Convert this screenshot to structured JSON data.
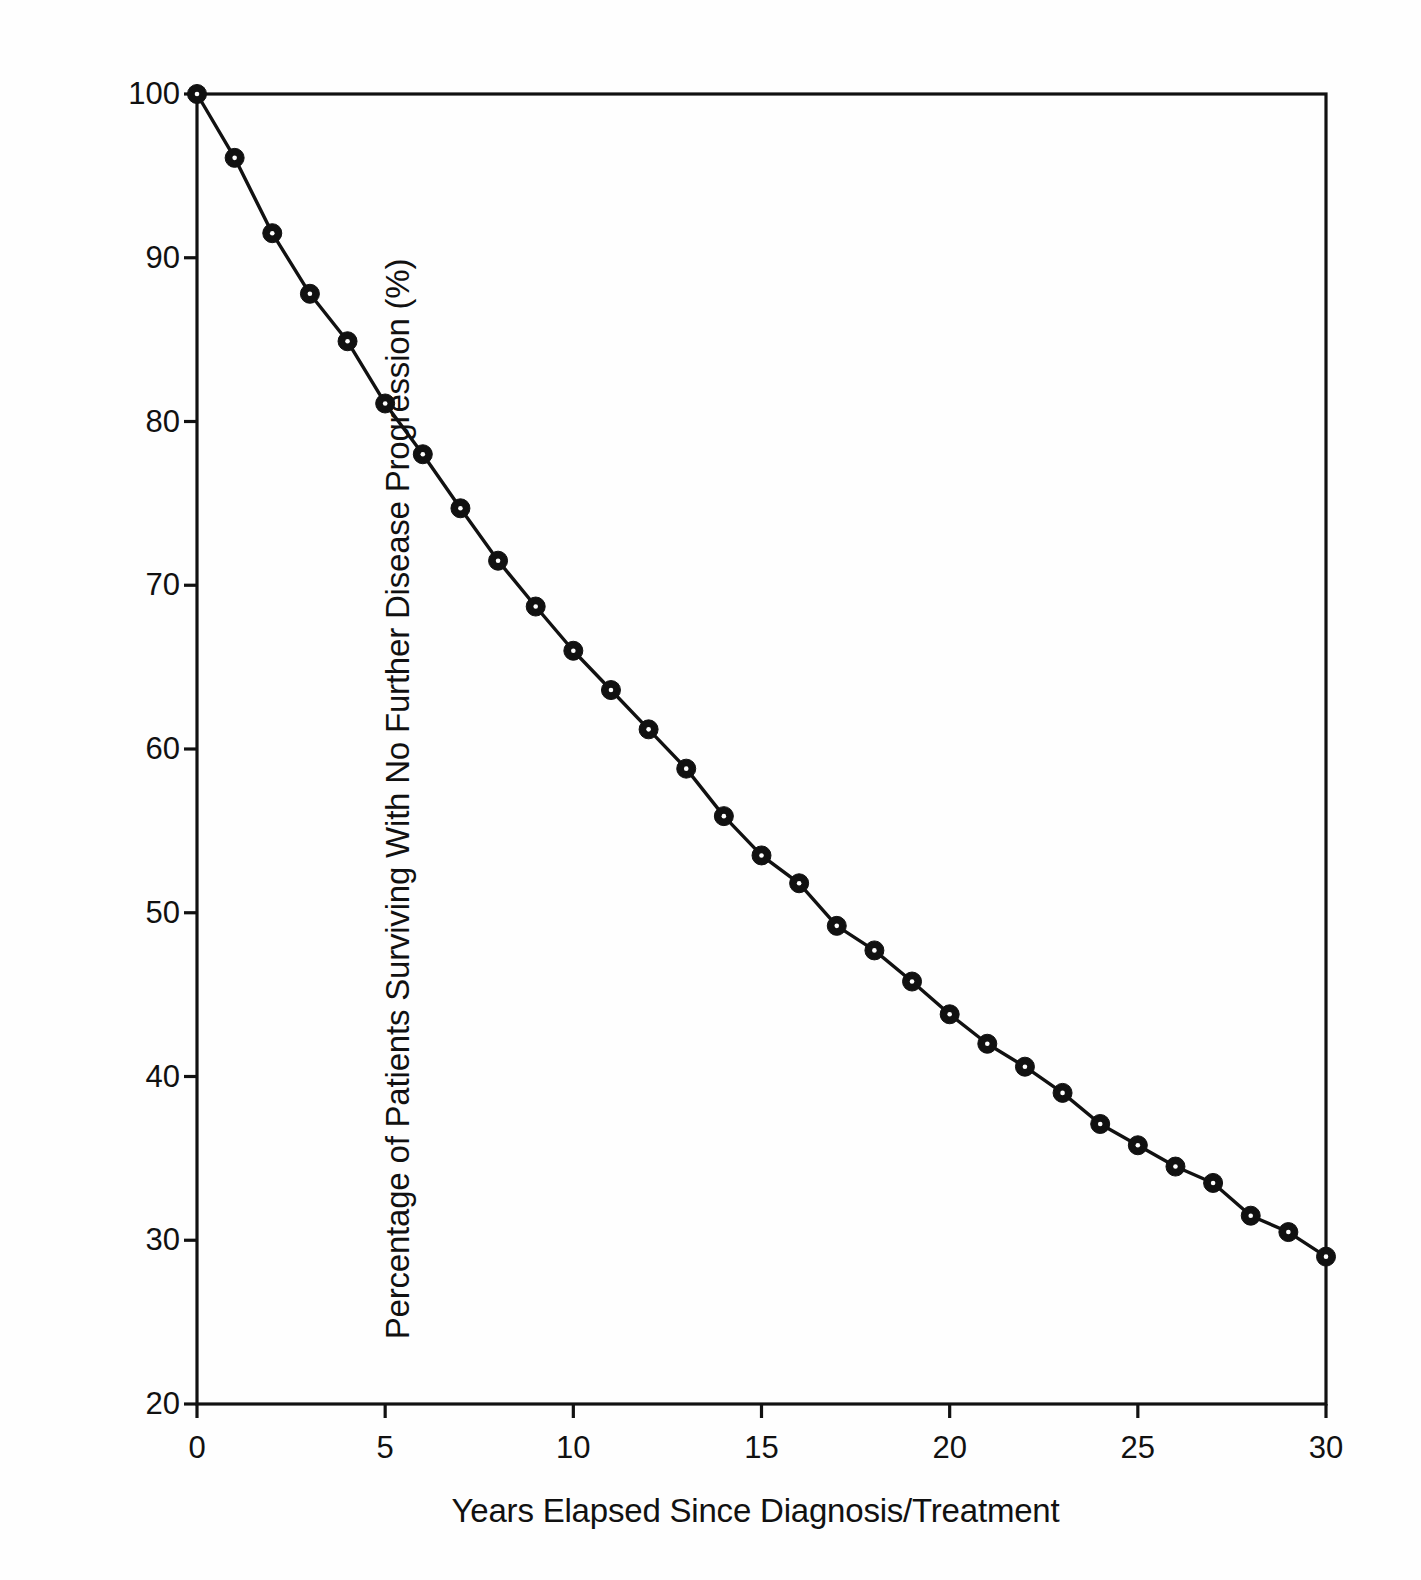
{
  "figure": {
    "background_color": "#fefefe",
    "ink_color": "#111111"
  },
  "chart_data": {
    "type": "line",
    "title": "",
    "subtitle": "",
    "xlabel": "Years Elapsed Since Diagnosis/Treatment",
    "ylabel": "Percentage of Patients Surviving With No Further Disease Progression (%)",
    "xlim": [
      0,
      30
    ],
    "ylim": [
      20,
      100
    ],
    "xticks": [
      0,
      5,
      10,
      15,
      20,
      25,
      30
    ],
    "xtick_labels": [
      "0",
      "5",
      "10",
      "15",
      "20",
      "25",
      "30"
    ],
    "yticks": [
      20,
      30,
      40,
      50,
      60,
      70,
      80,
      90,
      100
    ],
    "ytick_labels": [
      "20",
      "30",
      "40",
      "50",
      "60",
      "70",
      "80",
      "90",
      "100"
    ],
    "grid": false,
    "legend": null,
    "legend_position": "none",
    "marker": "filled-circle",
    "marker_color": "#111111",
    "line_color": "#111111",
    "annotations": [],
    "x": [
      0,
      1,
      2,
      3,
      4,
      5,
      6,
      7,
      8,
      9,
      10,
      11,
      12,
      13,
      14,
      15,
      16,
      17,
      18,
      19,
      20,
      21,
      22,
      23,
      24,
      25,
      26,
      27,
      28,
      29,
      30
    ],
    "series": [
      {
        "name": "Progression-free survival",
        "values": [
          100.0,
          96.1,
          91.5,
          87.8,
          84.9,
          81.1,
          78.0,
          74.7,
          71.5,
          68.7,
          66.0,
          63.6,
          61.2,
          58.8,
          55.9,
          53.5,
          51.8,
          49.2,
          47.7,
          45.8,
          43.8,
          42.0,
          40.6,
          39.0,
          37.1,
          35.8,
          34.5,
          33.5,
          31.5,
          30.5,
          29.0
        ]
      }
    ]
  },
  "axes": {
    "y_title": "Percentage of Patients Surviving With No Further Disease Progression (%)",
    "x_title": "Years Elapsed Since Diagnosis/Treatment"
  }
}
